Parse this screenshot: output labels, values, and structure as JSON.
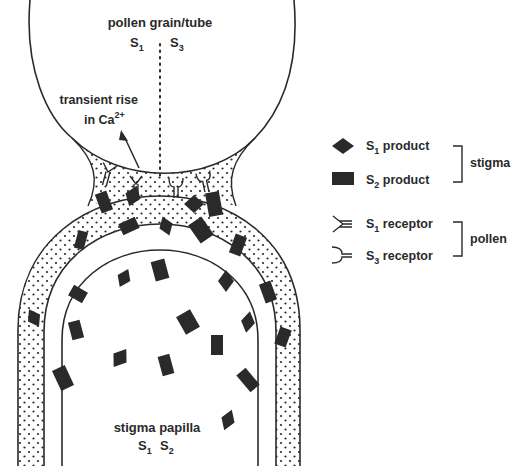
{
  "pollen": {
    "title": "pollen grain/tube",
    "alleles": [
      "S",
      "1",
      "S",
      "3"
    ]
  },
  "calcium": {
    "line1": "transient rise",
    "line2": "in Ca",
    "sup": "2+"
  },
  "stigma": {
    "title": "stigma papilla",
    "alleles": [
      "S",
      "1",
      "S",
      "2"
    ]
  },
  "legend": {
    "items": [
      {
        "prefix": "S",
        "sub": "1",
        "label": " product",
        "symbol": "diamond"
      },
      {
        "prefix": "S",
        "sub": "2",
        "label": " product",
        "symbol": "rectangle"
      },
      {
        "prefix": "S",
        "sub": "1",
        "label": " receptor",
        "symbol": "y-receptor"
      },
      {
        "prefix": "S",
        "sub": "3",
        "label": " receptor",
        "symbol": "u-receptor"
      }
    ],
    "groups": [
      "stigma",
      "pollen"
    ]
  },
  "colors": {
    "ink": "#2a2a2a",
    "background": "#ffffff"
  }
}
